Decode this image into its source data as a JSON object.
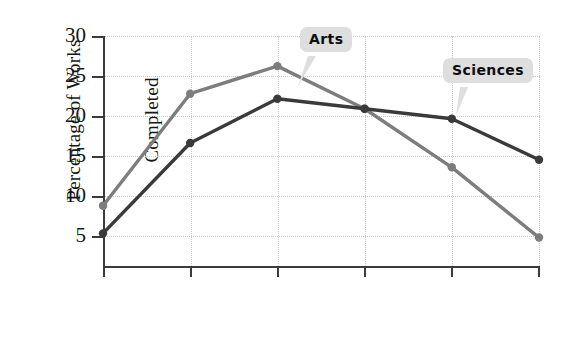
{
  "chart_data": {
    "type": "line",
    "title": "",
    "xlabel": "Age Decade",
    "ylabel_line1": "Percentage of Works",
    "ylabel_line2": "Completed",
    "categories": [
      "20s",
      "30s",
      "40s",
      "50s",
      "60s",
      "70s"
    ],
    "yticks": [
      5,
      10,
      15,
      20,
      25,
      30
    ],
    "ytick_labels": [
      "5",
      "10",
      "15",
      "20",
      "25",
      "30"
    ],
    "ylim": [
      2.5,
      30
    ],
    "grid": true,
    "legend_position": "inline-callouts",
    "series": [
      {
        "name": "Arts",
        "color": "#7d7d7d",
        "marker": "circle",
        "values": [
          9.7,
          23.1,
          26.4,
          21.3,
          14.3,
          5.9
        ]
      },
      {
        "name": "Sciences",
        "color": "#3a3a3a",
        "marker": "circle",
        "values": [
          6.4,
          17.2,
          22.5,
          21.3,
          20.1,
          15.2
        ]
      }
    ],
    "annotations": [
      {
        "text": "Arts",
        "target_series": "Arts",
        "target_category": "40s"
      },
      {
        "text": "Sciences",
        "target_series": "Sciences",
        "target_category": "60s"
      }
    ]
  },
  "axis": {
    "ytick_0": "5",
    "ytick_1": "10",
    "ytick_2": "15",
    "ytick_3": "20",
    "ytick_4": "25",
    "ytick_5": "30",
    "xtick_0": "20s",
    "xtick_1": "30s",
    "xtick_2": "40s",
    "xtick_3": "50s",
    "xtick_4": "60s",
    "xtick_5": "70s"
  },
  "callouts": {
    "arts": "Arts",
    "sciences": "Sciences"
  },
  "colors": {
    "arts_line": "#7d7d7d",
    "sciences_line": "#3a3a3a",
    "axis": "#3b3b3b",
    "grid": "#c9c9c9",
    "callout_bg": "#dedede",
    "background": "#ffffff"
  }
}
